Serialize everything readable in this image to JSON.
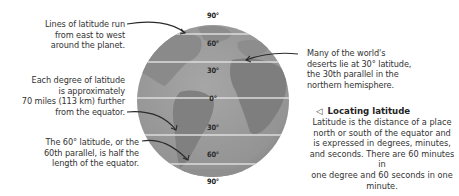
{
  "diagram": {
    "title": "Locating latitude",
    "caption_marker": "◁",
    "caption_body_lines": [
      "Latitude is the distance of a place",
      "north or south of the equator and",
      "is expressed in degrees, minutes,",
      "and seconds. There are 60 minutes in",
      "one degree and 60 seconds in one minute."
    ],
    "latitude_labels": {
      "north_pole": "90°",
      "n60": "60°",
      "n30": "30°",
      "equator": "0°",
      "s30": "30°",
      "s60": "60°",
      "south_pole": "90°"
    },
    "annotations": {
      "lines_of_latitude": [
        "Lines of latitude run",
        "from east to west",
        "around the planet."
      ],
      "each_degree": [
        "Each degree of latitude",
        "is approximately",
        "70 miles (113 km) further",
        "from the equator."
      ],
      "sixtieth_parallel": [
        "The 60° latitude, or the",
        "60th parallel, is half the",
        "length of the equator."
      ],
      "deserts": [
        "Many of the world's",
        "deserts lie at 30° latitude,",
        "the 30th parallel in the",
        "northern hemisphere."
      ]
    },
    "colors": {
      "globe_ocean": "#9a9a9a",
      "globe_land": "#7f7f7f",
      "latitude_line": "#d9d9d9",
      "text": "#333333",
      "arrow": "#2b2b2b"
    }
  }
}
